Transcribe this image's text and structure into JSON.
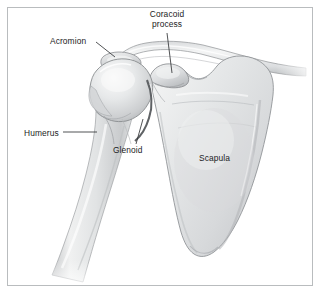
{
  "figure": {
    "frame_color": "#b9bcbe",
    "background_color": "#ffffff",
    "label_color": "#1b1c1e",
    "leader_color": "#333538",
    "bone_fill": "#e9eaeb",
    "bone_shade": "#bdbfc1",
    "bone_outline": "#8d9093"
  },
  "labels": {
    "coracoid_line1": "Coracoid",
    "coracoid_line2": "process",
    "acromion": "Acromion",
    "humerus": "Humerus",
    "glenoid": "Glenoid",
    "scapula": "Scapula"
  },
  "structures": [
    {
      "name": "clavicle",
      "label": "",
      "has_leader": false
    },
    {
      "name": "acromion",
      "label": "Acromion",
      "has_leader": true
    },
    {
      "name": "coracoid-process",
      "label": "Coracoid process",
      "has_leader": true
    },
    {
      "name": "humerus",
      "label": "Humerus",
      "has_leader": true
    },
    {
      "name": "glenoid",
      "label": "Glenoid",
      "has_leader": true
    },
    {
      "name": "scapula",
      "label": "Scapula",
      "has_leader": false
    }
  ]
}
